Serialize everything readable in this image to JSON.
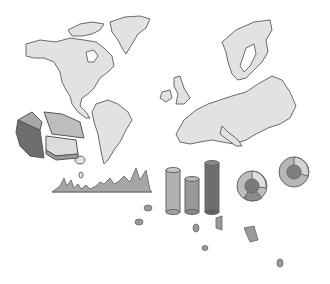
{
  "image": {
    "description": "Grayscale clip-art of world map (Americas and Europe) with decorative 3D charts",
    "background": "#ffffff"
  },
  "colors": {
    "land": "#e2e2e2",
    "outline": "#6a6a6a",
    "light": "#bdbdbd",
    "mid": "#9a9a9a",
    "dark": "#6e6e6e"
  },
  "elements": {
    "map_regions": [
      "north-america",
      "greenland",
      "south-america",
      "europe",
      "scandinavia",
      "british-isles"
    ],
    "charts": [
      "pie-chart-3d",
      "area-line-chart",
      "cylinder-bar-chart",
      "donut-chart-1",
      "donut-chart-2"
    ]
  }
}
